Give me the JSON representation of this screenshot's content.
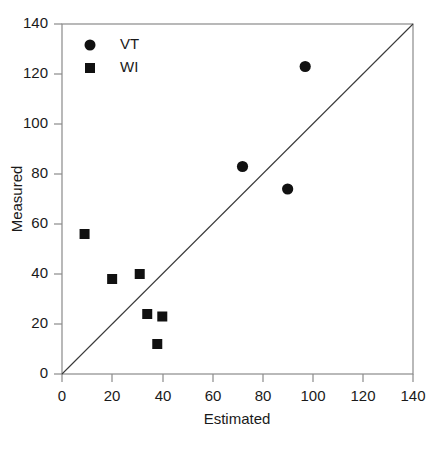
{
  "chart_data": {
    "type": "scatter",
    "title": "",
    "xlabel": "Estimated",
    "ylabel": "Measured",
    "xlim": [
      0,
      140
    ],
    "ylim": [
      0,
      140
    ],
    "xticks": [
      0,
      20,
      40,
      60,
      80,
      100,
      120,
      140
    ],
    "yticks": [
      0,
      20,
      40,
      60,
      80,
      100,
      120,
      140
    ],
    "grid": false,
    "legend_position": "top-left",
    "reference_line": {
      "name": "one-to-one-line",
      "from": [
        0,
        0
      ],
      "to": [
        140,
        140
      ],
      "label": "1:1 line"
    },
    "series": [
      {
        "name": "VT",
        "marker": "circle",
        "color": "#111111",
        "points": [
          {
            "x": 72,
            "y": 83
          },
          {
            "x": 90,
            "y": 74
          },
          {
            "x": 97,
            "y": 123
          }
        ]
      },
      {
        "name": "WI",
        "marker": "square",
        "color": "#111111",
        "points": [
          {
            "x": 9,
            "y": 56
          },
          {
            "x": 20,
            "y": 38
          },
          {
            "x": 31,
            "y": 40
          },
          {
            "x": 34,
            "y": 24
          },
          {
            "x": 40,
            "y": 23
          },
          {
            "x": 38,
            "y": 12
          }
        ]
      }
    ]
  },
  "legend": {
    "entries": [
      {
        "label": "VT",
        "marker": "circle"
      },
      {
        "label": "WI",
        "marker": "square"
      }
    ]
  },
  "page": {
    "bleed_text": ""
  }
}
